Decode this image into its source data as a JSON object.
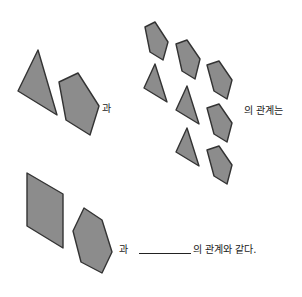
{
  "problem": {
    "text_1": "과",
    "text_2": "의 관계는",
    "text_3": "과",
    "text_4": "의 관계와 같다.",
    "blank_answer": ""
  },
  "colors": {
    "shape_fill": "#8c8c8c",
    "shape_stroke": "#333333"
  }
}
